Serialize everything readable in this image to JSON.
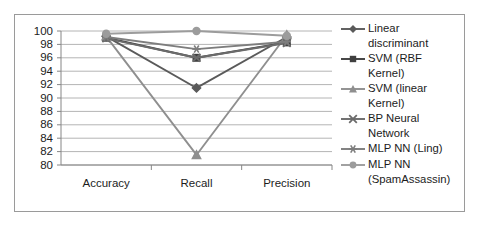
{
  "chart_data": {
    "type": "line",
    "title": "",
    "xlabel": "",
    "ylabel": "",
    "categories": [
      "Accuracy",
      "Recall",
      "Precision"
    ],
    "ylim": [
      80,
      100
    ],
    "ytick_labels": [
      "100",
      "98",
      "96",
      "94",
      "92",
      "90",
      "88",
      "86",
      "84",
      "82",
      "80"
    ],
    "yticks": [
      100,
      98,
      96,
      94,
      92,
      90,
      88,
      86,
      84,
      82,
      80
    ],
    "grid": true,
    "legend_position": "right",
    "series": [
      {
        "name": "Linear discriminant",
        "marker": "diamond",
        "color": "#5a5a5a",
        "values": [
          99.2,
          91.5,
          99.1
        ]
      },
      {
        "name": "SVM (RBF Kernel)",
        "marker": "square",
        "color": "#3f3f3f",
        "values": [
          99.0,
          96.0,
          98.3
        ]
      },
      {
        "name": "SVM (linear Kernel)",
        "marker": "triangle",
        "color": "#8f8f8f",
        "values": [
          99.2,
          81.5,
          99.4
        ]
      },
      {
        "name": "BP Neural Network",
        "marker": "x",
        "color": "#6b6b6b",
        "values": [
          98.9,
          96.0,
          98.2
        ]
      },
      {
        "name": "MLP NN (Ling)",
        "marker": "asterisk",
        "color": "#7d7d7d",
        "values": [
          99.1,
          97.3,
          98.4
        ]
      },
      {
        "name": "MLP NN (SpamAssassin)",
        "marker": "circle",
        "color": "#9c9c9c",
        "values": [
          99.6,
          100.0,
          99.3
        ]
      }
    ]
  },
  "legend": {
    "items": [
      {
        "label": "Linear discriminant",
        "marker": "diamond-marker",
        "color": "#5a5a5a"
      },
      {
        "label": "SVM (RBF Kernel)",
        "marker": "square-marker",
        "color": "#3f3f3f"
      },
      {
        "label": "SVM (linear Kernel)",
        "marker": "triangle-marker",
        "color": "#8f8f8f"
      },
      {
        "label": "BP Neural Network",
        "marker": "x-marker",
        "color": "#6b6b6b"
      },
      {
        "label": "MLP NN (Ling)",
        "marker": "asterisk-marker",
        "color": "#7d7d7d"
      },
      {
        "label": "MLP NN (SpamAssassin)",
        "marker": "circle-marker",
        "color": "#9c9c9c"
      }
    ]
  }
}
